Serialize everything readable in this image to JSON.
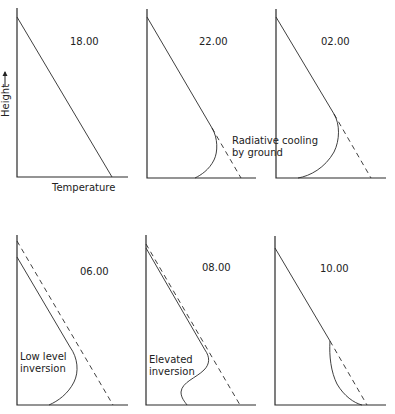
{
  "figure": {
    "axes": {
      "y_label": "Height",
      "y_arrow": "→",
      "x_label": "Temperature"
    },
    "panels": [
      {
        "time": "18.00",
        "annotation": []
      },
      {
        "time": "22.00",
        "annotation": [
          "Radiative cooling",
          "by ground"
        ]
      },
      {
        "time": "02.00",
        "annotation": []
      },
      {
        "time": "06.00",
        "annotation": [
          "Low level",
          "inversion"
        ]
      },
      {
        "time": "08.00",
        "annotation": [
          "Elevated",
          "inversion"
        ]
      },
      {
        "time": "10.00",
        "annotation": []
      }
    ],
    "colors": {
      "line": "#2a2a2a",
      "background": "#ffffff"
    }
  }
}
